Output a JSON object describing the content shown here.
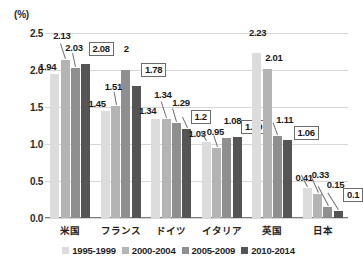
{
  "chart_data": {
    "type": "bar",
    "title": "",
    "subtitle": "",
    "xlabel": "",
    "ylabel": "(%)",
    "unit_label": "(%)",
    "ylim": [
      0.0,
      2.5
    ],
    "ytick_step": 0.5,
    "grid": true,
    "legend_position": "bottom",
    "categories": [
      "米国",
      "フランス",
      "ドイツ",
      "イタリア",
      "英国",
      "日本"
    ],
    "yticks": [
      "0.0",
      "0.5",
      "1.0",
      "1.5",
      "2.0",
      "2.5"
    ],
    "series": [
      {
        "name": "1995-1999",
        "color": "#dcdcdc",
        "values": [
          1.94,
          1.45,
          1.34,
          1.03,
          2.23,
          0.41
        ],
        "labels": [
          "1.94",
          "1.45",
          "1.34",
          "1.03",
          "2.23",
          "0.41"
        ]
      },
      {
        "name": "2000-2004",
        "color": "#b4b4b4",
        "values": [
          2.13,
          1.51,
          1.34,
          0.95,
          2.01,
          0.33
        ],
        "labels": [
          "2.13",
          "1.51",
          "1.34",
          "0.95",
          "2.01",
          "0.33"
        ]
      },
      {
        "name": "2005-2009",
        "color": "#8f8f8f",
        "values": [
          2.03,
          2.0,
          1.29,
          1.08,
          1.11,
          0.15
        ],
        "labels": [
          "2.03",
          "2",
          "1.29",
          "1.08",
          "1.11",
          "0.15"
        ]
      },
      {
        "name": "2010-2014",
        "color": "#555555",
        "values": [
          2.08,
          1.78,
          1.2,
          1.09,
          1.06,
          0.1
        ],
        "labels": [
          "2.08",
          "1.78",
          "1.2",
          "1.09",
          "1.06",
          "0.1"
        ]
      }
    ],
    "annotations": [
      {
        "text": "1.94",
        "boxed": false
      },
      {
        "text": "2.13",
        "boxed": false
      },
      {
        "text": "2.03",
        "boxed": false
      },
      {
        "text": "2.08",
        "boxed": true
      },
      {
        "text": "1.45",
        "boxed": false
      },
      {
        "text": "1.51",
        "boxed": false
      },
      {
        "text": "2",
        "boxed": false
      },
      {
        "text": "1.78",
        "boxed": true
      },
      {
        "text": "1.34",
        "boxed": false
      },
      {
        "text": "1.34",
        "boxed": false
      },
      {
        "text": "1.29",
        "boxed": false
      },
      {
        "text": "1.2",
        "boxed": true
      },
      {
        "text": "1.03",
        "boxed": false
      },
      {
        "text": "0.95",
        "boxed": false
      },
      {
        "text": "1.08",
        "boxed": false
      },
      {
        "text": "1.09",
        "boxed": true
      },
      {
        "text": "2.23",
        "boxed": false
      },
      {
        "text": "2.01",
        "boxed": false
      },
      {
        "text": "1.11",
        "boxed": false
      },
      {
        "text": "1.06",
        "boxed": true
      },
      {
        "text": "0.41",
        "boxed": false
      },
      {
        "text": "0.33",
        "boxed": false
      },
      {
        "text": "0.15",
        "boxed": false
      },
      {
        "text": "0.1",
        "boxed": true
      }
    ]
  },
  "legend": {
    "items": [
      {
        "label": "1995-1999",
        "color": "#dcdcdc"
      },
      {
        "label": "2000-2004",
        "color": "#b4b4b4"
      },
      {
        "label": "2005-2009",
        "color": "#8f8f8f"
      },
      {
        "label": "2010-2014",
        "color": "#555555"
      }
    ]
  }
}
